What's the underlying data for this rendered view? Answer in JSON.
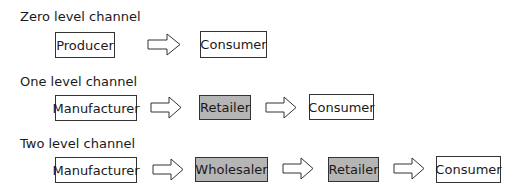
{
  "rows": [
    {
      "title": "Zero level channel",
      "nodes": [
        {
          "label": "Producer",
          "shaded": false
        },
        {
          "label": "Consumer",
          "shaded": false
        }
      ]
    },
    {
      "title": "One level channel",
      "nodes": [
        {
          "label": "Manufacturer",
          "shaded": false
        },
        {
          "label": "Retailer",
          "shaded": true
        },
        {
          "label": "Consumer",
          "shaded": false
        }
      ]
    },
    {
      "title": "Two level channel",
      "nodes": [
        {
          "label": "Manufacturer",
          "shaded": false
        },
        {
          "label": "Wholesaler",
          "shaded": true
        },
        {
          "label": "Retailer",
          "shaded": true
        },
        {
          "label": "Consumer",
          "shaded": false
        }
      ]
    }
  ],
  "colors": {
    "shaded_fill": "#b5b5b5",
    "border": "#333333"
  },
  "icons": {
    "arrow": "right-block-arrow"
  }
}
